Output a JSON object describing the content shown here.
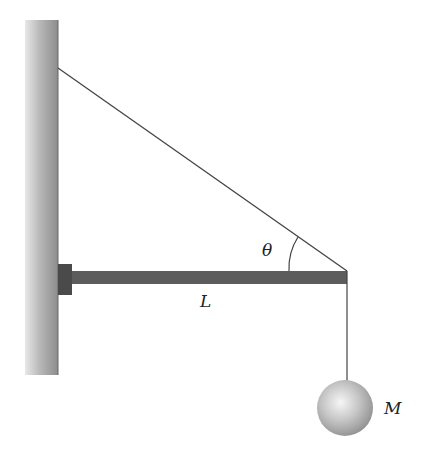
{
  "diagram": {
    "labels": {
      "angle": "θ",
      "length": "L",
      "mass": "M"
    },
    "colors": {
      "wall_light": "#e4e4e4",
      "wall_dark": "#8a8a8a",
      "beam": "#5a5a5a",
      "bracket": "#4a4a4a",
      "cable": "#444444",
      "ball_light": "#f4f4f4",
      "ball_dark": "#9a9a9a"
    }
  }
}
